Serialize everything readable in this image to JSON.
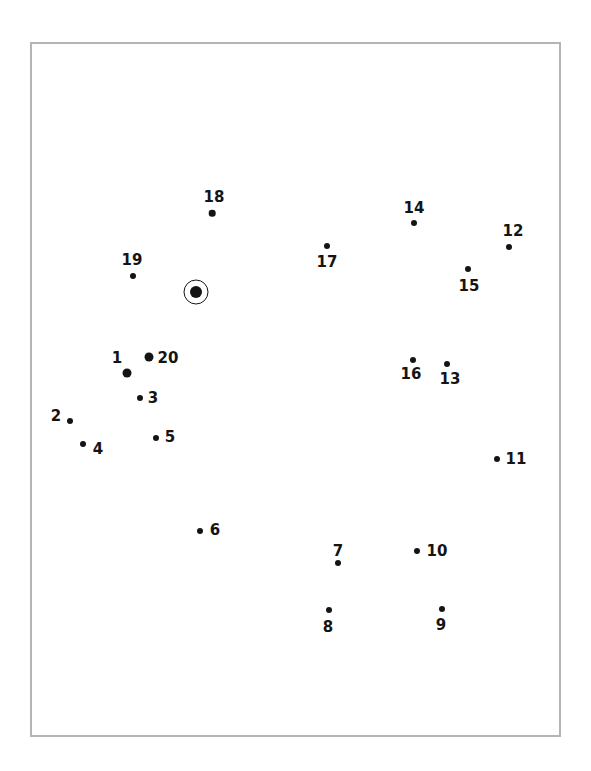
{
  "colors": {
    "ink": "#141414",
    "frame_border": "#b4b4b4",
    "background": "#ffffff"
  },
  "chart_data": {
    "type": "scatter",
    "description_of_marks": "numbered-dots-with-one-circled-unlabeled-dot",
    "points": [
      {
        "label": "1",
        "x": 127,
        "y": 373,
        "r": 4.5,
        "label_x": 117,
        "label_y": 358
      },
      {
        "label": "2",
        "x": 70,
        "y": 421,
        "r": 3,
        "label_x": 56,
        "label_y": 416
      },
      {
        "label": "3",
        "x": 140,
        "y": 398,
        "r": 3,
        "label_x": 153,
        "label_y": 398
      },
      {
        "label": "4",
        "x": 83,
        "y": 444,
        "r": 3,
        "label_x": 98,
        "label_y": 449
      },
      {
        "label": "5",
        "x": 156,
        "y": 438,
        "r": 3,
        "label_x": 170,
        "label_y": 437
      },
      {
        "label": "6",
        "x": 200,
        "y": 531,
        "r": 3,
        "label_x": 215,
        "label_y": 530
      },
      {
        "label": "7",
        "x": 338,
        "y": 563,
        "r": 3,
        "label_x": 338,
        "label_y": 551
      },
      {
        "label": "8",
        "x": 329,
        "y": 610,
        "r": 3,
        "label_x": 328,
        "label_y": 627
      },
      {
        "label": "9",
        "x": 442,
        "y": 609,
        "r": 3,
        "label_x": 441,
        "label_y": 625
      },
      {
        "label": "10",
        "x": 417,
        "y": 551,
        "r": 3,
        "label_x": 437,
        "label_y": 551
      },
      {
        "label": "11",
        "x": 497,
        "y": 459,
        "r": 3,
        "label_x": 516,
        "label_y": 459
      },
      {
        "label": "12",
        "x": 509,
        "y": 247,
        "r": 3,
        "label_x": 513,
        "label_y": 231
      },
      {
        "label": "13",
        "x": 447,
        "y": 364,
        "r": 3,
        "label_x": 450,
        "label_y": 379
      },
      {
        "label": "14",
        "x": 414,
        "y": 223,
        "r": 3,
        "label_x": 414,
        "label_y": 208
      },
      {
        "label": "15",
        "x": 468,
        "y": 269,
        "r": 3,
        "label_x": 469,
        "label_y": 286
      },
      {
        "label": "16",
        "x": 413,
        "y": 360,
        "r": 3,
        "label_x": 411,
        "label_y": 374
      },
      {
        "label": "17",
        "x": 327,
        "y": 246,
        "r": 3,
        "label_x": 327,
        "label_y": 262
      },
      {
        "label": "18",
        "x": 212,
        "y": 213,
        "r": 3.3,
        "label_x": 214,
        "label_y": 197
      },
      {
        "label": "19",
        "x": 133,
        "y": 276,
        "r": 3,
        "label_x": 132,
        "label_y": 260
      },
      {
        "label": "20",
        "x": 149,
        "y": 357,
        "r": 4.5,
        "label_x": 168,
        "label_y": 358
      }
    ],
    "circled_point": {
      "x": 196,
      "y": 292,
      "dot_radius": 6,
      "ring_radius": 12.5
    }
  }
}
